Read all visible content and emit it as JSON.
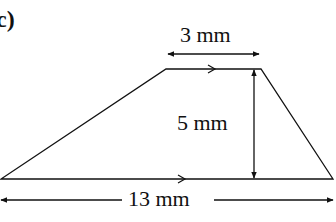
{
  "part_label": "c)",
  "shape": "trapezium",
  "dimensions": {
    "top": "3 mm",
    "height": "5 mm",
    "bottom": "13 mm"
  },
  "colors": {
    "line": "#111111",
    "background": "#ffffff"
  }
}
